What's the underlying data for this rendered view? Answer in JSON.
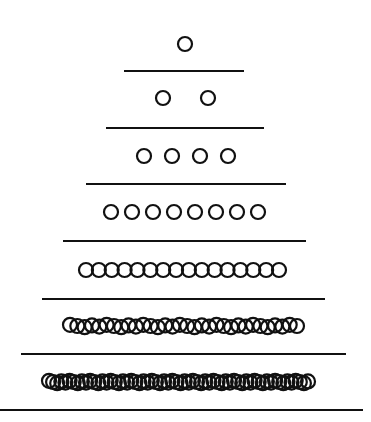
{
  "diagram": {
    "title": "",
    "colors": {
      "ink": "#111111",
      "background": "#ffffff"
    },
    "circle_radius": 7,
    "rows": [
      {
        "count": 1,
        "y": 44,
        "x_start": 185,
        "x_end": 185
      },
      {
        "count": 2,
        "y": 98,
        "x_start": 163,
        "x_end": 208
      },
      {
        "count": 4,
        "y": 156,
        "x_start": 144,
        "x_end": 228
      },
      {
        "count": 8,
        "y": 212,
        "x_start": 111,
        "x_end": 258
      },
      {
        "count": 16,
        "y": 270,
        "x_start": 86,
        "x_end": 279
      },
      {
        "count": 32,
        "y": 326,
        "x_start": 70,
        "x_end": 297
      },
      {
        "count": 64,
        "y": 382,
        "x_start": 49,
        "x_end": 308
      }
    ],
    "lines": [
      {
        "y": 71,
        "x1": 124,
        "x2": 244
      },
      {
        "y": 128,
        "x1": 106,
        "x2": 264
      },
      {
        "y": 184,
        "x1": 86,
        "x2": 286
      },
      {
        "y": 241,
        "x1": 63,
        "x2": 306
      },
      {
        "y": 299,
        "x1": 42,
        "x2": 325
      },
      {
        "y": 354,
        "x1": 21,
        "x2": 346
      },
      {
        "y": 410,
        "x1": 0,
        "x2": 363
      }
    ]
  }
}
